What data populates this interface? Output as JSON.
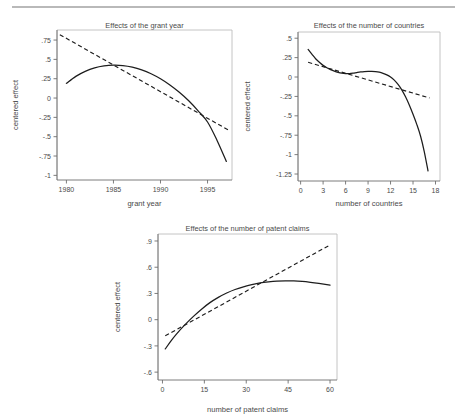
{
  "figure": {
    "background": "#ffffff",
    "rule_color": "#b9b9b9",
    "curve_color": "#1d1d1d",
    "axis_color": "#6e6e6e"
  },
  "chart_data": [
    {
      "id": "grant-year",
      "type": "line",
      "title": "Effects of the grant year",
      "xlabel": "grant year",
      "ylabel": "centered effect",
      "xlim": [
        1979.0,
        1997.6
      ],
      "ylim": [
        -1.06,
        0.88
      ],
      "xticks": [
        1980,
        1985,
        1990,
        1995
      ],
      "xtick_labels": [
        "1980",
        "1985",
        "1990",
        "1995"
      ],
      "yticks": [
        0.75,
        0.5,
        0.25,
        0,
        -0.25,
        -0.5,
        -0.75,
        -1
      ],
      "ytick_labels": [
        ".75",
        ".5",
        ".25",
        "0",
        "-.25",
        "-.5",
        "-.75",
        "-1"
      ],
      "grid": false,
      "legend": "none",
      "series": [
        {
          "name": "nonlinear effect",
          "style": "solid",
          "x": [
            1980,
            1981,
            1982,
            1983,
            1984,
            1985,
            1986,
            1987,
            1988,
            1989,
            1990,
            1991,
            1992,
            1993,
            1994,
            1995,
            1996,
            1997
          ],
          "y": [
            0.19,
            0.28,
            0.345,
            0.39,
            0.415,
            0.425,
            0.42,
            0.4,
            0.365,
            0.315,
            0.25,
            0.17,
            0.075,
            -0.035,
            -0.165,
            -0.31,
            -0.545,
            -0.82
          ]
        },
        {
          "name": "linear effect",
          "style": "dashed",
          "x": [
            1979.3,
            1997.3
          ],
          "y": [
            0.82,
            -0.42
          ]
        }
      ]
    },
    {
      "id": "number-of-countries",
      "type": "line",
      "title": "Effects of the number of countries",
      "xlabel": "number of countries",
      "ylabel": "centered effect",
      "xlim": [
        -0.35,
        18.6
      ],
      "ylim": [
        -1.34,
        0.58
      ],
      "xticks": [
        0,
        3,
        6,
        9,
        12,
        15,
        18
      ],
      "xtick_labels": [
        "0",
        "3",
        "6",
        "9",
        "12",
        "15",
        "18"
      ],
      "yticks": [
        0.5,
        0.25,
        0,
        -0.25,
        -0.5,
        -0.75,
        -1,
        -1.25
      ],
      "ytick_labels": [
        ".5",
        ".25",
        "0",
        "-.25",
        "-.5",
        "-.75",
        "-1",
        "-1.25"
      ],
      "grid": false,
      "legend": "none",
      "series": [
        {
          "name": "nonlinear effect",
          "style": "solid",
          "x": [
            1.0,
            1.5,
            2.0,
            2.5,
            3.0,
            3.5,
            4.0,
            4.5,
            5.0,
            5.5,
            6.0,
            6.5,
            7.0,
            7.5,
            8.0,
            8.5,
            9.0,
            9.5,
            10.0,
            10.5,
            11.0,
            11.5,
            12.0,
            12.5,
            13.0,
            13.5,
            14.0,
            14.5,
            15.0,
            15.5,
            16.0,
            16.5,
            17.0
          ],
          "y": [
            0.355,
            0.295,
            0.235,
            0.19,
            0.15,
            0.12,
            0.095,
            0.075,
            0.06,
            0.05,
            0.045,
            0.045,
            0.05,
            0.058,
            0.065,
            0.07,
            0.073,
            0.073,
            0.07,
            0.062,
            0.048,
            0.028,
            0.0,
            -0.04,
            -0.095,
            -0.165,
            -0.255,
            -0.36,
            -0.48,
            -0.61,
            -0.76,
            -0.96,
            -1.21
          ]
        },
        {
          "name": "linear effect",
          "style": "dashed",
          "x": [
            1.0,
            17.2
          ],
          "y": [
            0.19,
            -0.27
          ]
        }
      ]
    },
    {
      "id": "number-of-patent-claims",
      "type": "line",
      "title": "Effects of the number of patent claims",
      "xlabel": "number of patent claims",
      "ylabel": "centered effect",
      "xlim": [
        -1.6,
        62.5
      ],
      "ylim": [
        -0.69,
        0.98
      ],
      "xticks": [
        0,
        15,
        30,
        45,
        60
      ],
      "xtick_labels": [
        "0",
        "15",
        "30",
        "45",
        "60"
      ],
      "yticks": [
        0.9,
        0.6,
        0.3,
        0,
        -0.3,
        -0.6
      ],
      "ytick_labels": [
        ".9",
        ".6",
        ".3",
        "0",
        "-.3",
        "-.6"
      ],
      "grid": false,
      "legend": "none",
      "series": [
        {
          "name": "nonlinear effect",
          "style": "solid",
          "x": [
            1,
            3,
            5,
            8,
            11,
            14,
            17,
            20,
            23,
            26,
            29,
            32,
            35,
            38,
            41,
            44,
            47,
            50,
            53,
            56,
            60
          ],
          "y": [
            -0.335,
            -0.245,
            -0.165,
            -0.06,
            0.035,
            0.12,
            0.195,
            0.255,
            0.305,
            0.345,
            0.375,
            0.4,
            0.42,
            0.432,
            0.44,
            0.443,
            0.443,
            0.438,
            0.428,
            0.415,
            0.395
          ]
        },
        {
          "name": "linear effect",
          "style": "dashed",
          "x": [
            1.0,
            60.0
          ],
          "y": [
            -0.185,
            0.855
          ]
        }
      ]
    }
  ]
}
